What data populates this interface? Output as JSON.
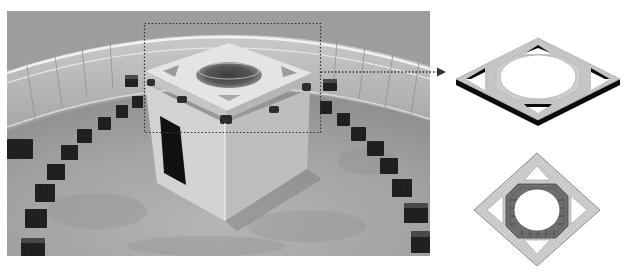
{
  "figure": {
    "caption": "",
    "photo": {
      "description": "Grayscale photograph of a cube-shaped building with perforated roof slab, surrounded by a ring of small blocks and a curved railing",
      "colors": {
        "sky": "#9c9c9c",
        "floor": "#a8a8a8",
        "cube_light": "#dcdcdc",
        "cube_shadow": "#a0a0a0",
        "door": "#111111",
        "blocks": "#1e1e1e"
      }
    },
    "callout": {
      "box": {
        "x": 144,
        "y": 23,
        "width": 176,
        "height": 109,
        "style": "dotted"
      },
      "arrow": {
        "from_x": 320,
        "to_x": 444,
        "y": 72,
        "style": "dotted"
      }
    },
    "diagrams": [
      {
        "name": "roof-slab-isometric",
        "description": "Isometric drawing of square roof slab with central circular opening and four triangular corner openings"
      },
      {
        "name": "roof-slab-underside",
        "description": "Isometric view from below of roof slab showing octagonal ribbed frame around circular opening"
      }
    ]
  }
}
